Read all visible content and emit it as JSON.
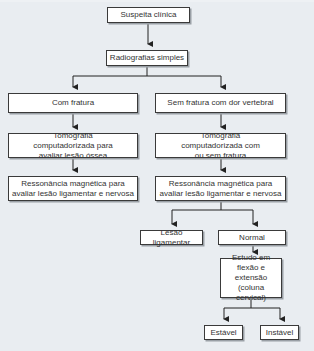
{
  "flowchart": {
    "nodes": {
      "suspeita": "Suspeita clínica",
      "radiografias": "Radiografias simples",
      "com_fratura": "Com fratura",
      "sem_fratura": "Sem fratura com dor vertebral",
      "tomo_left": "Tomografia computadorizada para avaliar lesão óssea",
      "tomo_right": "Tomografia computadorizada com ou sem fratura",
      "resso_left": "Ressonância magnética para avaliar lesão ligamentar e nervosa",
      "resso_right": "Ressonância magnética para avaliar lesão ligamentar e nervosa",
      "lesao": "Lesão ligamentar",
      "normal": "Normal",
      "estudo": "Estudo em flexão e extensão (coluna cervical)",
      "estavel": "Estável",
      "instavel": "Instável"
    },
    "colors": {
      "background": "#e9edf1",
      "box_fill": "#ffffff",
      "box_border": "#3a3a3a",
      "line": "#222222"
    }
  }
}
